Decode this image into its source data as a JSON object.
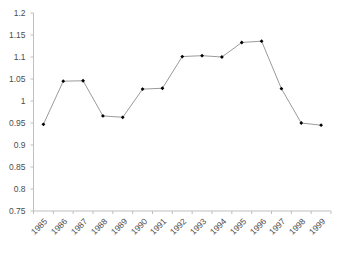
{
  "chart_data": {
    "type": "line",
    "title": "",
    "xlabel": "",
    "ylabel": "",
    "categories": [
      "1985",
      "1986",
      "1987",
      "1988",
      "1989",
      "1990",
      "1991",
      "1992",
      "1993",
      "1994",
      "1995",
      "1996",
      "1997",
      "1998",
      "1999"
    ],
    "values": [
      0.947,
      1.045,
      1.046,
      0.966,
      0.963,
      1.027,
      1.029,
      1.101,
      1.103,
      1.1,
      1.133,
      1.136,
      1.028,
      0.95,
      0.945
    ],
    "series": [
      {
        "name": "series-1",
        "values": [
          0.947,
          1.045,
          1.046,
          0.966,
          0.963,
          1.027,
          1.029,
          1.101,
          1.103,
          1.1,
          1.133,
          1.136,
          1.028,
          0.95,
          0.945
        ]
      }
    ],
    "ylim": [
      0.75,
      1.2
    ],
    "ytick_step": 0.05,
    "ytick_labels": [
      "1.2",
      "1.15",
      "1.1",
      "1.05",
      "1",
      "0.95",
      "0.9",
      "0.85",
      "0.8",
      "0.75"
    ],
    "ytick_values": [
      1.2,
      1.15,
      1.1,
      1.05,
      1.0,
      0.95,
      0.9,
      0.85,
      0.8,
      0.75
    ],
    "xtick_labels": [
      "1985",
      "1986",
      "1987",
      "1988",
      "1989",
      "1990",
      "1991",
      "1992",
      "1993",
      "1994",
      "1995",
      "1996",
      "1997",
      "1998",
      "1999"
    ],
    "grid": false,
    "legend": false,
    "legend_position": "none",
    "marker": "diamond",
    "colors": {
      "line": "#808080",
      "marker": "#000000",
      "axis": "#bfbfbf",
      "tick_text": "#4d4d4d",
      "background": "#ffffff"
    }
  },
  "ghost_title": ""
}
